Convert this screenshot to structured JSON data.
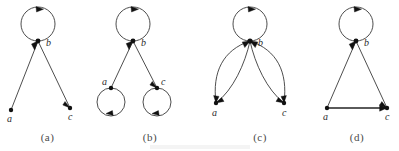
{
  "figure": {
    "background_color": "#ffffff",
    "ink_color": "#3a3a3a",
    "node_color": "#111111",
    "caption_color": "#4a4a4a",
    "panel_count": 4
  },
  "panels": [
    {
      "caption": "(a)",
      "nodes": [
        {
          "id": "b",
          "label": "b",
          "x": 38,
          "y": 41,
          "label_dx": 8,
          "label_dy": 5
        },
        {
          "id": "a",
          "label": "a",
          "x": 11,
          "y": 110,
          "label_dx": -2,
          "label_dy": 12
        },
        {
          "id": "c",
          "label": "c",
          "x": 70,
          "y": 108,
          "label_dx": -1,
          "label_dy": 12
        }
      ],
      "self_loops": [
        {
          "at": "b",
          "radius": 17,
          "arrow_angle": "top"
        }
      ],
      "edges": [
        {
          "from": "b",
          "to": "a",
          "style": "straight",
          "arrow_at": "both"
        },
        {
          "from": "b",
          "to": "c",
          "style": "straight",
          "arrow_at": "both"
        }
      ]
    },
    {
      "caption": "(b)",
      "nodes": [
        {
          "id": "b",
          "label": "b",
          "x": 38,
          "y": 41,
          "label_dx": 8,
          "label_dy": 5
        },
        {
          "id": "a",
          "label": "a",
          "x": 16,
          "y": 88,
          "label_dx": -8,
          "label_dy": -2
        },
        {
          "id": "c",
          "label": "c",
          "x": 62,
          "y": 88,
          "label_dx": 5,
          "label_dy": -2
        }
      ],
      "self_loops": [
        {
          "at": "b",
          "radius": 17,
          "arrow_angle": "top"
        },
        {
          "at": "a",
          "radius": 14,
          "arrow_angle": "bottom"
        },
        {
          "at": "c",
          "radius": 14,
          "arrow_angle": "bottom"
        }
      ],
      "edges": [
        {
          "from": "b",
          "to": "a",
          "style": "straight",
          "arrow_at": "both"
        },
        {
          "from": "b",
          "to": "c",
          "style": "straight",
          "arrow_at": "both"
        }
      ]
    },
    {
      "caption": "(c)",
      "nodes": [
        {
          "id": "b",
          "label": "b",
          "x": 45,
          "y": 41,
          "label_dx": 8,
          "label_dy": 5
        },
        {
          "id": "a",
          "label": "a",
          "x": 11,
          "y": 103,
          "label_dx": -2,
          "label_dy": 13
        },
        {
          "id": "c",
          "label": "c",
          "x": 79,
          "y": 103,
          "label_dx": -1,
          "label_dy": 13
        }
      ],
      "self_loops": [
        {
          "at": "b",
          "radius": 17,
          "arrow_angle": "top"
        }
      ],
      "edges": [
        {
          "from": "b",
          "to": "a",
          "style": "curve-outer",
          "arrow_at": "both"
        },
        {
          "from": "b",
          "to": "a",
          "style": "curve-inner",
          "arrow_at": "both"
        },
        {
          "from": "b",
          "to": "c",
          "style": "curve-outer",
          "arrow_at": "both"
        },
        {
          "from": "b",
          "to": "c",
          "style": "curve-inner",
          "arrow_at": "both"
        }
      ]
    },
    {
      "caption": "(d)",
      "nodes": [
        {
          "id": "b",
          "label": "b",
          "x": 41,
          "y": 41,
          "label_dx": 8,
          "label_dy": 5
        },
        {
          "id": "a",
          "label": "a",
          "x": 12,
          "y": 108,
          "label_dx": -2,
          "label_dy": 12
        },
        {
          "id": "c",
          "label": "c",
          "x": 72,
          "y": 108,
          "label_dx": -1,
          "label_dy": 12
        }
      ],
      "self_loops": [
        {
          "at": "b",
          "radius": 17,
          "arrow_angle": "top"
        }
      ],
      "edges": [
        {
          "from": "b",
          "to": "a",
          "style": "straight",
          "arrow_at": "both"
        },
        {
          "from": "b",
          "to": "c",
          "style": "straight",
          "arrow_at": "both"
        },
        {
          "from": "a",
          "to": "c",
          "style": "straight-thick",
          "arrow_at": "end"
        }
      ]
    }
  ]
}
